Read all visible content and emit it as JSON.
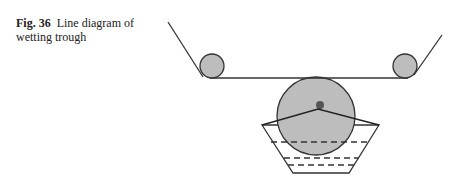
{
  "caption": {
    "label": "Fig. 36",
    "text": "Line diagram of wetting trough"
  },
  "figure": {
    "description": "Line diagram of wetting trough",
    "colors": {
      "stroke": "#333333",
      "roller_fill": "#bdbdbd",
      "hub_fill": "#555555"
    },
    "parts": [
      "left-guide-roller",
      "right-guide-roller",
      "fabric-belt",
      "immersion-roller",
      "trough",
      "liquor-levels"
    ]
  }
}
